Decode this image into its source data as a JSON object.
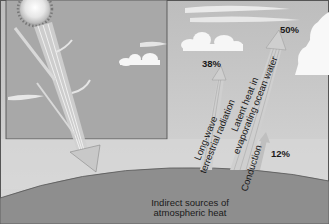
{
  "diagram": {
    "title": "Indirect sources of atmospheric heat",
    "ground_label": [
      "Indirect sources of",
      "atmospheric heat"
    ],
    "flows": [
      {
        "id": "longwave",
        "label_lines": [
          "Long-wave",
          "terrestrial radiation"
        ],
        "percent": "38%"
      },
      {
        "id": "latent",
        "label_lines": [
          "Latent heat in",
          "evaporating ocean water"
        ],
        "percent": "50%"
      },
      {
        "id": "conduction",
        "label_lines": [
          "Conduction"
        ],
        "percent": "12%"
      }
    ],
    "inset": {
      "description": "Incoming solar radiation from the sun, partly reflected and scattered, reaching the surface"
    },
    "colors": {
      "sky": "#c9c9c9",
      "inset_sky": "#a9a9a9",
      "ground": "#8f8f8f",
      "arrow": "#d2d2d2",
      "text": "#1a1a1a"
    }
  }
}
